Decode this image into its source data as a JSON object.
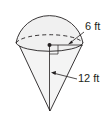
{
  "figure": {
    "labels": {
      "radius": "6 ft",
      "height": "12 ft"
    },
    "colors": {
      "stroke": "#231f20",
      "fill": "#f2f2f2",
      "background": "#ffffff"
    }
  }
}
